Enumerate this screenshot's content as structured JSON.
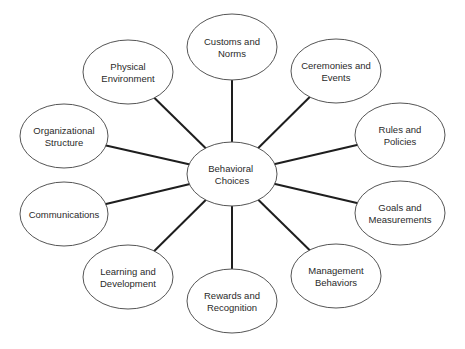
{
  "diagram": {
    "type": "hub-and-spoke",
    "center": {
      "id": "behavioral-choices",
      "lines": [
        "Behavioral",
        "Choices"
      ],
      "cx": 232,
      "cy": 174,
      "rx": 45,
      "ry": 32
    },
    "nodes": [
      {
        "id": "customs-and-norms",
        "lines": [
          "Customs and",
          "Norms"
        ],
        "cx": 232,
        "cy": 47,
        "rx": 45,
        "ry": 33
      },
      {
        "id": "ceremonies-and-events",
        "lines": [
          "Ceremonies and",
          "Events"
        ],
        "cx": 336,
        "cy": 71,
        "rx": 45,
        "ry": 32
      },
      {
        "id": "rules-and-policies",
        "lines": [
          "Rules and",
          "Policies"
        ],
        "cx": 400,
        "cy": 135,
        "rx": 45,
        "ry": 32
      },
      {
        "id": "goals-and-measurements",
        "lines": [
          "Goals and",
          "Measurements"
        ],
        "cx": 400,
        "cy": 213,
        "rx": 45,
        "ry": 32
      },
      {
        "id": "management-behaviors",
        "lines": [
          "Management",
          "Behaviors"
        ],
        "cx": 336,
        "cy": 276,
        "rx": 45,
        "ry": 32
      },
      {
        "id": "rewards-and-recognition",
        "lines": [
          "Rewards and",
          "Recognition"
        ],
        "cx": 232,
        "cy": 301,
        "rx": 45,
        "ry": 32
      },
      {
        "id": "learning-and-development",
        "lines": [
          "Learning and",
          "Development"
        ],
        "cx": 128,
        "cy": 277,
        "rx": 45,
        "ry": 32
      },
      {
        "id": "communications",
        "lines": [
          "Communications"
        ],
        "cx": 64,
        "cy": 214,
        "rx": 44,
        "ry": 32
      },
      {
        "id": "organizational-structure",
        "lines": [
          "Organizational",
          "Structure"
        ],
        "cx": 64,
        "cy": 136,
        "rx": 44,
        "ry": 32
      },
      {
        "id": "physical-environment",
        "lines": [
          "Physical",
          "Environment"
        ],
        "cx": 128,
        "cy": 72,
        "rx": 45,
        "ry": 32
      }
    ],
    "colors": {
      "background": "#ffffff",
      "ellipse_stroke": "#555555",
      "connector": "#1e1e1e",
      "text": "#2a2a2a"
    }
  }
}
